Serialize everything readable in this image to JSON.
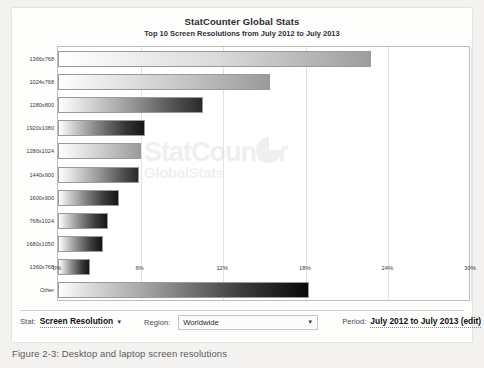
{
  "caption": "Figure 2-3: Desktop and laptop screen resolutions",
  "chart": {
    "title": "StatCounter Global Stats",
    "subtitle": "Top 10 Screen Resolutions from July 2012 to July 2013",
    "watermark_top": "StatCounter",
    "watermark_bottom": "GlobalStats"
  },
  "controls": {
    "stat_label": "Stat:",
    "stat_value": "Screen Resolution",
    "stat_caret": "▼",
    "region_label": "Region:",
    "region_value": "Worldwide",
    "region_caret": "▼",
    "period_label": "Period:",
    "period_value": "July 2012 to July 2013 (edit)"
  },
  "chart_data": {
    "type": "bar",
    "orientation": "horizontal",
    "title": "StatCounter Global Stats",
    "subtitle": "Top 10 Screen Resolutions from July 2012 to July 2013",
    "xlabel": "",
    "ylabel": "",
    "xlim": [
      0,
      30
    ],
    "xticks": [
      "0%",
      "6%",
      "12%",
      "18%",
      "24%",
      "30%"
    ],
    "xtick_values": [
      0,
      6,
      12,
      18,
      24,
      30
    ],
    "grid": true,
    "legend": false,
    "categories": [
      "1366x768",
      "1024x768",
      "1280x800",
      "1920x1080",
      "1280x1024",
      "1440x900",
      "1600x900",
      "768x1024",
      "1680x1050",
      "1360x768",
      "Other"
    ],
    "values": [
      22.7,
      15.4,
      10.5,
      6.3,
      6.0,
      5.9,
      4.4,
      3.6,
      3.3,
      2.3,
      18.2
    ],
    "units": "percent"
  }
}
